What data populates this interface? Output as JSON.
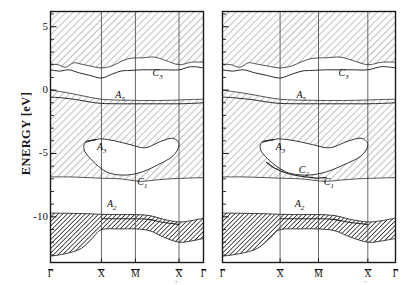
{
  "figure": {
    "kind": "surface-projected-band-structure",
    "yaxis": {
      "title": "ENERGY [eV]",
      "unit": "eV",
      "min": -13.6,
      "max": 6.2,
      "major_ticks": [
        5,
        0,
        -5,
        -10
      ],
      "major_tick_labels": [
        "5",
        "0",
        "-5",
        "-10"
      ],
      "minor_tick_step": 1
    },
    "colors": {
      "frame": "#1a1a1a",
      "curve": "#2a2a2a",
      "hatch_light": "#9a9a9a",
      "hatch_dark": "#1f1f1f",
      "gridline": "#555555",
      "background": "#ffffff"
    }
  },
  "panels": [
    {
      "id": "left-panel",
      "name": "left-panel",
      "xticks": [
        {
          "label": "Γ",
          "overbar": true,
          "prime": false,
          "frac": 0.0
        },
        {
          "label": "X",
          "overbar": true,
          "prime": false,
          "frac": 0.333
        },
        {
          "label": "M",
          "overbar": true,
          "prime": false,
          "frac": 0.555
        },
        {
          "label": "X",
          "overbar": true,
          "prime": true,
          "frac": 0.84
        },
        {
          "label": "Γ",
          "overbar": true,
          "prime": false,
          "frac": 1.0
        }
      ],
      "band_labels": [
        {
          "text": "C",
          "sub": "3",
          "frac_x": 0.7,
          "energy": 1.25
        },
        {
          "text": "A",
          "sub": "5",
          "frac_x": 0.455,
          "energy": -0.45
        },
        {
          "text": "A",
          "sub": "3",
          "frac_x": 0.335,
          "energy": -4.55
        },
        {
          "text": "C",
          "sub": "1",
          "frac_x": 0.6,
          "energy": -7.3
        }
      ],
      "bottom_band_label": {
        "text": "A",
        "sub": "2",
        "frac_x": 0.4,
        "energy": -9.05
      }
    },
    {
      "id": "right-panel",
      "name": "right-panel",
      "xticks": [
        {
          "label": "Γ",
          "overbar": true,
          "prime": false,
          "frac": 0.0
        },
        {
          "label": "X",
          "overbar": true,
          "prime": false,
          "frac": 0.333
        },
        {
          "label": "M",
          "overbar": true,
          "prime": false,
          "frac": 0.555
        },
        {
          "label": "X",
          "overbar": true,
          "prime": true,
          "frac": 0.84
        },
        {
          "label": "Γ",
          "overbar": true,
          "prime": false,
          "frac": 1.0
        }
      ],
      "band_labels": [
        {
          "text": "C",
          "sub": "3",
          "frac_x": 0.7,
          "energy": 1.25
        },
        {
          "text": "A",
          "sub": "5",
          "frac_x": 0.455,
          "energy": -0.45
        },
        {
          "text": "A",
          "sub": "3",
          "frac_x": 0.335,
          "energy": -4.55
        },
        {
          "text": "C",
          "sub": "2",
          "frac_x": 0.47,
          "energy": -6.35
        },
        {
          "text": "C",
          "sub": "1",
          "frac_x": 0.615,
          "energy": -7.35
        }
      ],
      "bottom_band_label": {
        "text": "A",
        "sub": "2",
        "frac_x": 0.445,
        "energy": -9.05
      }
    }
  ],
  "chart_data": {
    "type": "line",
    "title": "",
    "xlabel": "",
    "ylabel": "ENERGY [eV]",
    "ylim": [
      -13.6,
      6.2
    ],
    "grid": false,
    "legend": null,
    "x_categories": [
      "Γ̅",
      "X̅",
      "M̅",
      "X̅'",
      "Γ̅"
    ],
    "x_category_fracs": [
      0.0,
      0.333,
      0.555,
      0.84,
      1.0
    ],
    "panels": [
      {
        "name": "left-panel",
        "series": [
          {
            "name": "upper-projected-edge-C3",
            "role": "boundary between shaded bulk continuum above and projected gap below",
            "x": [
              0.0,
              0.05,
              0.1,
              0.15,
              0.2,
              0.26,
              0.333,
              0.4,
              0.46,
              0.52,
              0.6,
              0.68,
              0.75,
              0.84,
              0.92,
              1.0
            ],
            "y": [
              2.05,
              2.0,
              1.8,
              2.15,
              2.05,
              1.9,
              1.75,
              1.9,
              2.25,
              2.5,
              2.55,
              2.6,
              2.35,
              2.0,
              2.2,
              2.2
            ]
          },
          {
            "name": "surface-state-C3",
            "role": "surface band C3",
            "x": [
              0.0,
              0.06,
              0.12,
              0.19,
              0.26,
              0.333,
              0.4,
              0.46,
              0.52,
              0.6,
              0.68,
              0.75,
              0.84,
              0.92,
              1.0
            ],
            "y": [
              1.6,
              1.5,
              1.6,
              1.35,
              1.15,
              0.95,
              1.25,
              1.5,
              1.55,
              1.6,
              1.6,
              1.6,
              1.6,
              1.85,
              1.75
            ]
          },
          {
            "name": "lower-gap-edge-A5-top",
            "role": "top edge of the shaded band containing A5",
            "x": [
              0.0,
              0.08,
              0.17,
              0.25,
              0.333,
              0.42,
              0.5,
              0.6,
              0.7,
              0.8,
              0.9,
              1.0
            ],
            "y": [
              0.0,
              -0.15,
              -0.35,
              -0.55,
              -0.72,
              -0.78,
              -0.8,
              -0.82,
              -0.82,
              -0.8,
              -0.75,
              -0.72
            ]
          },
          {
            "name": "surface-state-A5",
            "role": "surface band A5",
            "x": [
              0.0,
              0.08,
              0.17,
              0.25,
              0.333,
              0.45,
              0.56,
              0.7,
              0.84,
              0.92,
              1.0
            ],
            "y": [
              -0.55,
              -0.62,
              -0.75,
              -0.92,
              -1.05,
              -1.08,
              -1.08,
              -1.08,
              -1.08,
              -1.05,
              -1.0
            ]
          },
          {
            "name": "pocket-A3-outline",
            "role": "closed projected-gap pocket containing surface band A3",
            "x_closed": [
              0.23,
              0.3,
              0.333,
              0.42,
              0.52,
              0.62,
              0.72,
              0.8,
              0.84,
              0.8,
              0.7,
              0.6,
              0.5,
              0.4,
              0.333,
              0.26,
              0.22,
              0.23
            ],
            "y_closed": [
              -4.1,
              -3.9,
              -3.85,
              -4.0,
              -4.3,
              -4.55,
              -4.05,
              -3.8,
              -4.3,
              -5.2,
              -5.9,
              -6.45,
              -6.7,
              -6.6,
              -6.2,
              -5.4,
              -4.7,
              -4.1
            ]
          },
          {
            "name": "C1-edge",
            "role": "lower continuum edge near C1",
            "x": [
              0.0,
              0.12,
              0.24,
              0.333,
              0.45,
              0.55,
              0.6,
              0.68,
              0.78,
              0.88,
              1.0
            ],
            "y": [
              -6.85,
              -6.85,
              -6.9,
              -6.95,
              -7.0,
              -7.15,
              -7.2,
              -7.1,
              -7.0,
              -6.95,
              -6.9
            ]
          },
          {
            "name": "A2-band-upper-edge",
            "role": "top edge of the dark hatched bulk band (A2)",
            "x": [
              0.0,
              0.12,
              0.24,
              0.333,
              0.45,
              0.555,
              0.65,
              0.74,
              0.84,
              0.92,
              1.0
            ],
            "y": [
              -9.7,
              -9.72,
              -9.75,
              -9.8,
              -9.82,
              -9.82,
              -9.9,
              -10.2,
              -10.4,
              -10.3,
              -10.1
            ]
          },
          {
            "name": "A2-surface-band",
            "role": "surface band A2 just below upper edge",
            "x": [
              0.333,
              0.42,
              0.5,
              0.555,
              0.64,
              0.74,
              0.84
            ],
            "y": [
              -10.15,
              -10.15,
              -10.15,
              -10.15,
              -10.2,
              -10.45,
              -10.6
            ]
          },
          {
            "name": "A2-band-lower-edge",
            "role": "bottom edge of the dark hatched bulk band",
            "x": [
              0.0,
              0.1,
              0.2,
              0.28,
              0.333,
              0.45,
              0.555,
              0.65,
              0.74,
              0.84,
              0.92,
              1.0
            ],
            "y": [
              -13.1,
              -12.9,
              -12.5,
              -11.6,
              -11.0,
              -10.95,
              -10.95,
              -11.1,
              -11.6,
              -12.0,
              -11.9,
              -11.7
            ]
          }
        ]
      },
      {
        "name": "right-panel",
        "series": [
          {
            "name": "upper-projected-edge-C3",
            "role": "boundary between shaded bulk continuum above and projected gap below",
            "x": [
              0.0,
              0.05,
              0.1,
              0.15,
              0.2,
              0.26,
              0.333,
              0.4,
              0.46,
              0.52,
              0.6,
              0.68,
              0.75,
              0.84,
              0.92,
              1.0
            ],
            "y": [
              2.05,
              2.0,
              1.8,
              2.15,
              2.05,
              1.9,
              1.75,
              1.9,
              2.25,
              2.5,
              2.55,
              2.6,
              2.35,
              2.0,
              2.2,
              2.2
            ]
          },
          {
            "name": "surface-state-C3",
            "role": "surface band C3",
            "x": [
              0.0,
              0.06,
              0.12,
              0.19,
              0.26,
              0.333,
              0.4,
              0.46,
              0.52,
              0.6,
              0.68,
              0.75,
              0.84,
              0.92,
              1.0
            ],
            "y": [
              1.6,
              1.5,
              1.6,
              1.35,
              1.15,
              0.95,
              1.25,
              1.5,
              1.55,
              1.6,
              1.6,
              1.6,
              1.6,
              1.85,
              1.75
            ]
          },
          {
            "name": "lower-gap-edge-A5-top",
            "role": "top edge of the shaded band containing A5",
            "x": [
              0.0,
              0.08,
              0.17,
              0.25,
              0.333,
              0.42,
              0.5,
              0.6,
              0.7,
              0.8,
              0.9,
              1.0
            ],
            "y": [
              0.0,
              -0.15,
              -0.35,
              -0.55,
              -0.72,
              -0.78,
              -0.8,
              -0.82,
              -0.82,
              -0.8,
              -0.75,
              -0.72
            ]
          },
          {
            "name": "surface-state-A5",
            "role": "surface band A5",
            "x": [
              0.0,
              0.08,
              0.17,
              0.25,
              0.333,
              0.45,
              0.56,
              0.7,
              0.84,
              0.92,
              1.0
            ],
            "y": [
              -0.55,
              -0.62,
              -0.75,
              -0.92,
              -1.05,
              -1.08,
              -1.08,
              -1.08,
              -1.08,
              -1.05,
              -1.0
            ]
          },
          {
            "name": "pocket-A3-C2-outline",
            "role": "closed projected-gap pocket containing surface bands A3 and C2",
            "x_closed": [
              0.23,
              0.3,
              0.333,
              0.42,
              0.52,
              0.62,
              0.72,
              0.8,
              0.84,
              0.8,
              0.7,
              0.6,
              0.5,
              0.4,
              0.333,
              0.26,
              0.22,
              0.23
            ],
            "y_closed": [
              -4.1,
              -3.9,
              -3.85,
              -4.0,
              -4.3,
              -4.55,
              -4.05,
              -3.8,
              -4.3,
              -5.2,
              -5.9,
              -6.45,
              -6.7,
              -6.6,
              -6.2,
              -5.4,
              -4.7,
              -4.1
            ]
          },
          {
            "name": "surface-state-C2",
            "role": "surface band C2 inside the pocket",
            "x": [
              0.255,
              0.3,
              0.36,
              0.42,
              0.48,
              0.53,
              0.555,
              0.6
            ],
            "y": [
              -5.7,
              -6.15,
              -6.5,
              -6.72,
              -6.85,
              -6.92,
              -6.95,
              -6.9
            ]
          },
          {
            "name": "C1-edge",
            "role": "lower continuum edge near C1",
            "x": [
              0.0,
              0.12,
              0.24,
              0.333,
              0.45,
              0.55,
              0.6,
              0.68,
              0.78,
              0.88,
              1.0
            ],
            "y": [
              -6.85,
              -6.85,
              -6.9,
              -6.95,
              -7.0,
              -7.15,
              -7.2,
              -7.1,
              -7.0,
              -6.95,
              -6.9
            ]
          },
          {
            "name": "A2-band-upper-edge",
            "role": "top edge of the dark hatched bulk band (A2)",
            "x": [
              0.0,
              0.12,
              0.24,
              0.333,
              0.45,
              0.555,
              0.65,
              0.74,
              0.84,
              0.92,
              1.0
            ],
            "y": [
              -9.7,
              -9.72,
              -9.75,
              -9.8,
              -9.82,
              -9.82,
              -9.9,
              -10.2,
              -10.4,
              -10.3,
              -10.1
            ]
          },
          {
            "name": "A2-surface-band",
            "role": "surface band A2 just below upper edge",
            "x": [
              0.333,
              0.42,
              0.5,
              0.555,
              0.64,
              0.74,
              0.84
            ],
            "y": [
              -10.15,
              -10.15,
              -10.15,
              -10.15,
              -10.2,
              -10.45,
              -10.6
            ]
          },
          {
            "name": "A2-band-lower-edge",
            "role": "bottom edge of the dark hatched bulk band",
            "x": [
              0.0,
              0.1,
              0.2,
              0.28,
              0.333,
              0.45,
              0.555,
              0.65,
              0.74,
              0.84,
              0.92,
              1.0
            ],
            "y": [
              -13.1,
              -12.9,
              -12.5,
              -11.6,
              -11.0,
              -10.95,
              -10.95,
              -11.1,
              -11.6,
              -12.0,
              -11.9,
              -11.7
            ]
          }
        ]
      }
    ]
  }
}
